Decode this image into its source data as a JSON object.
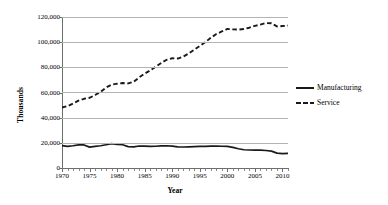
{
  "chart_data": {
    "type": "line",
    "title": "",
    "xlabel": "Year",
    "ylabel": "Thousands",
    "xlim": [
      1970,
      2011
    ],
    "ylim": [
      0,
      120000
    ],
    "grid": true,
    "legend_position": "right",
    "y_ticks": [
      0,
      20000,
      40000,
      60000,
      80000,
      100000,
      120000
    ],
    "y_tick_labels": [
      "0",
      "20,000",
      "40,000",
      "60,000",
      "80,000",
      "100,000",
      "120,000"
    ],
    "x_ticks": [
      1970,
      1975,
      1980,
      1985,
      1990,
      1995,
      2000,
      2005,
      2010
    ],
    "x_tick_labels": [
      "1970",
      "1975",
      "1980",
      "1985",
      "1990",
      "1995",
      "2000",
      "2005",
      "2010"
    ],
    "x": [
      1970,
      1971,
      1972,
      1973,
      1974,
      1975,
      1976,
      1977,
      1978,
      1979,
      1980,
      1981,
      1982,
      1983,
      1984,
      1985,
      1986,
      1987,
      1988,
      1989,
      1990,
      1991,
      1992,
      1993,
      1994,
      1995,
      1996,
      1997,
      1998,
      1999,
      2000,
      2001,
      2002,
      2003,
      2004,
      2005,
      2006,
      2007,
      2008,
      2009,
      2010,
      2011
    ],
    "series": [
      {
        "name": "Manufacturing",
        "style": "solid",
        "color": "#1a1a1a",
        "values": [
          17800,
          17200,
          17700,
          18400,
          18300,
          16600,
          17200,
          17700,
          18500,
          19400,
          18700,
          18500,
          17000,
          16800,
          17500,
          17400,
          17200,
          17300,
          17600,
          17700,
          17400,
          16800,
          16700,
          16800,
          17000,
          17200,
          17200,
          17400,
          17500,
          17300,
          17200,
          16400,
          15300,
          14500,
          14300,
          14200,
          14200,
          13900,
          13400,
          11800,
          11500,
          11700
        ]
      },
      {
        "name": "Service",
        "style": "dashed",
        "color": "#1a1a1a",
        "values": [
          48000,
          49200,
          51200,
          53500,
          55000,
          55800,
          58000,
          60500,
          64000,
          66200,
          67000,
          67500,
          67200,
          68500,
          72000,
          75000,
          77500,
          80500,
          83500,
          86000,
          87200,
          87000,
          88500,
          91000,
          94000,
          97000,
          100000,
          103500,
          106500,
          108500,
          110500,
          110200,
          110000,
          110500,
          111500,
          113000,
          114000,
          115200,
          115000,
          112500,
          112800,
          113200
        ]
      }
    ]
  },
  "legend": {
    "items": [
      {
        "label": "Manufacturing",
        "style": "solid"
      },
      {
        "label": "Service",
        "style": "dashed"
      }
    ]
  }
}
